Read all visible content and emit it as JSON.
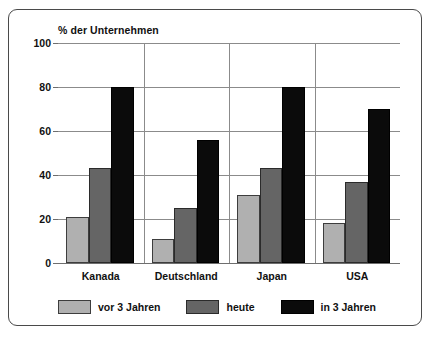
{
  "chart_data": {
    "type": "bar",
    "title": "% der Unternehmen",
    "xlabel": "",
    "ylabel": "",
    "ylim": [
      0,
      100
    ],
    "yticks": [
      0,
      20,
      40,
      60,
      80,
      100
    ],
    "ytick_labels": [
      "0",
      "20",
      "40",
      "60",
      "80",
      "100"
    ],
    "grid": true,
    "legend_position": "bottom",
    "categories": [
      "Kanada",
      "Deutschland",
      "Japan",
      "USA"
    ],
    "series": [
      {
        "name": "vor 3 Jahren",
        "color": "#b0b0b0",
        "values": [
          21,
          11,
          31,
          18
        ]
      },
      {
        "name": "heute",
        "color": "#656565",
        "values": [
          43,
          25,
          43,
          37
        ]
      },
      {
        "name": "in 3 Jahren",
        "color": "#0b0b0b",
        "values": [
          80,
          56,
          80,
          70
        ]
      }
    ]
  },
  "frame": {
    "border_color": "#4a4a4a"
  }
}
